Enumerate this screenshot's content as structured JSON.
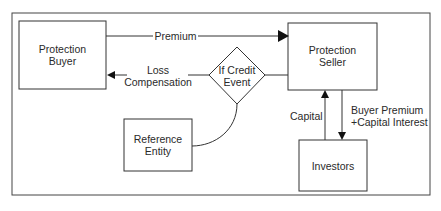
{
  "diagram": {
    "nodes": {
      "protection_buyer": {
        "line1": "Protection",
        "line2": "Buyer"
      },
      "protection_seller": {
        "line1": "Protection",
        "line2": "Seller"
      },
      "credit_event": {
        "line1": "If Credit",
        "line2": "Event"
      },
      "reference_entity": {
        "line1": "Reference",
        "line2": "Entity"
      },
      "investors": {
        "line1": "Investors"
      }
    },
    "edges": {
      "premium": {
        "label": "Premium"
      },
      "loss_compensation": {
        "line1": "Loss",
        "line2": "Compensation"
      },
      "capital": {
        "label": "Capital"
      },
      "buyer_premium": {
        "line1": "Buyer Premium",
        "line2": "+Capital Interest"
      }
    },
    "colors": {
      "stroke": "#333333",
      "background": "#ffffff"
    }
  }
}
